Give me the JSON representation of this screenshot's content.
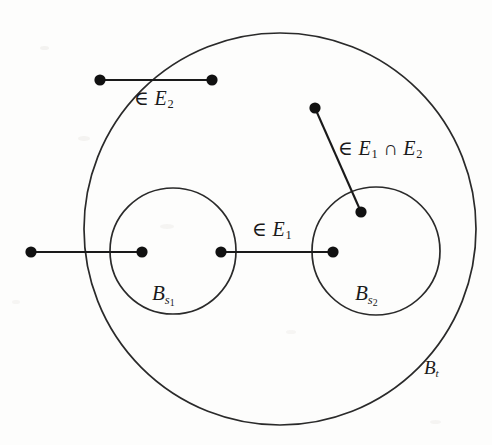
{
  "figure": {
    "type": "set-diagram",
    "background_color": "#fdfdfc",
    "stroke_color": "#1a1a1a",
    "node_color": "#111111",
    "canvas": {
      "width": 492,
      "height": 445
    }
  },
  "regions": [
    {
      "id": "outer-ball",
      "label_html": "B<sub>t</sub>",
      "label_plain": "B_t",
      "cx": 280,
      "cy": 229,
      "r": 196,
      "label_x": 424,
      "label_y": 358
    },
    {
      "id": "left-inner-ball",
      "label_html": "B<sub>s<sub>1</sub></sub>",
      "label_plain": "B_s1",
      "cx": 173,
      "cy": 251,
      "r": 63,
      "label_x": 152,
      "label_y": 283
    },
    {
      "id": "right-inner-ball",
      "label_html": "B<sub>s<sub>2</sub></sub>",
      "label_plain": "B_s2",
      "cx": 376,
      "cy": 251,
      "r": 64,
      "label_x": 355,
      "label_y": 283
    }
  ],
  "edges": [
    {
      "id": "edge-e2",
      "label_html": "&#8712; <i>E</i><sub>2</sub>",
      "label_plain": "∈ E2",
      "x1": 100,
      "y1": 80,
      "x2": 212,
      "y2": 80,
      "label_x": 134,
      "label_y": 88
    },
    {
      "id": "edge-e1-cap-e2",
      "label_html": "&#8712; <i>E</i><sub>1</sub> &#8745; <i>E</i><sub>2</sub>",
      "label_plain": "∈ E1 ∩ E2",
      "x1": 315,
      "y1": 108,
      "x2": 361,
      "y2": 212,
      "label_x": 338,
      "label_y": 138
    },
    {
      "id": "edge-e1-left",
      "label_html": "",
      "label_plain": "",
      "x1": 31,
      "y1": 252,
      "x2": 142,
      "y2": 252,
      "label_x": null,
      "label_y": null
    },
    {
      "id": "edge-e1-middle",
      "label_html": "&#8712; <i>E</i><sub>1</sub>",
      "label_plain": "∈ E1",
      "x1": 221,
      "y1": 252,
      "x2": 333,
      "y2": 252,
      "label_x": 252,
      "label_y": 219
    }
  ],
  "nodes": [
    {
      "id": "node-e2-left",
      "cx": 100,
      "cy": 80,
      "r": 5.6
    },
    {
      "id": "node-e2-right",
      "cx": 212,
      "cy": 80,
      "r": 5.6
    },
    {
      "id": "node-cap-outer",
      "cx": 315,
      "cy": 108,
      "r": 5.6
    },
    {
      "id": "node-cap-inner",
      "cx": 361,
      "cy": 212,
      "r": 5.6
    },
    {
      "id": "node-e1-far-left",
      "cx": 31,
      "cy": 252,
      "r": 5.6
    },
    {
      "id": "node-e1-in-left",
      "cx": 142,
      "cy": 252,
      "r": 5.6
    },
    {
      "id": "node-e1-edge-left",
      "cx": 221,
      "cy": 252,
      "r": 5.6
    },
    {
      "id": "node-e1-in-right",
      "cx": 333,
      "cy": 252,
      "r": 5.6
    }
  ]
}
